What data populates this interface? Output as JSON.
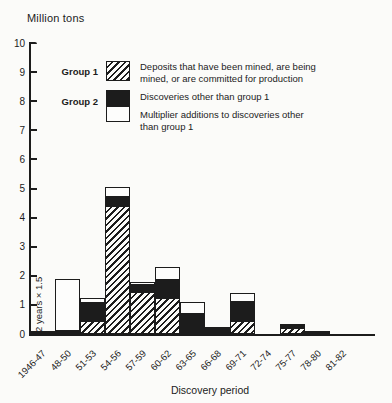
{
  "title": "Million tons",
  "xlabel": "Discovery period",
  "annotation": "2 years × 1.5",
  "colors": {
    "ink": "#1c1c1c",
    "paper": "#fbfbf9"
  },
  "legend": {
    "group1_label": "Group 1",
    "group2_label": "Group 2",
    "entries": [
      {
        "swatch": "hatched",
        "text": "Deposits that have been mined, are being\nmined, or are committed for production"
      },
      {
        "swatch": "black",
        "text": "Discoveries other than group 1"
      },
      {
        "swatch": "white",
        "text": "Multiplier additions to discoveries other\nthan group 1"
      }
    ]
  },
  "chart_data": {
    "type": "bar",
    "subtype": "stacked",
    "title": "Million tons",
    "xlabel": "Discovery period",
    "ylabel": "Million tons",
    "ylim": [
      0,
      10
    ],
    "yticks": [
      0,
      1,
      2,
      3,
      4,
      5,
      6,
      7,
      8,
      9,
      10
    ],
    "grid": false,
    "legend_position": "upper-left",
    "categories": [
      "1946-47",
      "48-50",
      "51-53",
      "54-56",
      "57-59",
      "60-62",
      "63-65",
      "66-68",
      "69-71",
      "72-74",
      "75-77",
      "78-80",
      "81-82"
    ],
    "series": [
      {
        "name": "Group 1 – Deposits that have been mined, are being mined, or are committed for production",
        "style": "hatched",
        "values": [
          0,
          0,
          0.45,
          4.4,
          1.45,
          1.25,
          0,
          0,
          0.45,
          0,
          0.2,
          0,
          0
        ]
      },
      {
        "name": "Group 2 – Discoveries other than group 1",
        "style": "black",
        "values": [
          0.1,
          0.1,
          0.6,
          0.3,
          0.25,
          0.6,
          0.7,
          0.25,
          0.65,
          0,
          0.1,
          0.12,
          0
        ]
      },
      {
        "name": "Group 2 – Multiplier additions to discoveries other than group 1",
        "style": "white",
        "values": [
          0,
          1.8,
          0.2,
          0.35,
          0.1,
          0.45,
          0.4,
          0,
          0.3,
          0,
          0.05,
          0,
          0
        ]
      }
    ],
    "totals": [
      0.1,
      1.9,
      1.25,
      5.05,
      1.8,
      2.3,
      1.1,
      0.25,
      1.4,
      0,
      0.35,
      0.12,
      0
    ],
    "annotation": {
      "text": "2 years × 1.5",
      "target_category": "48-50"
    }
  }
}
